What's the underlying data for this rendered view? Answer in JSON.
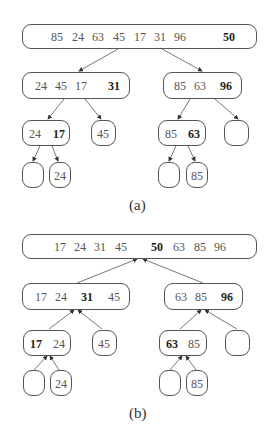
{
  "figure": {
    "part_a": {
      "caption": "(a)",
      "root": {
        "values": [
          "85",
          "24",
          "63",
          "45",
          "17",
          "31",
          "96"
        ],
        "pivot": "50"
      },
      "left": {
        "values": [
          "24",
          "45",
          "17"
        ],
        "pivot": "31"
      },
      "right": {
        "values": [
          "85",
          "63"
        ],
        "pivot": "96"
      },
      "left_left": {
        "values": [
          "24"
        ],
        "pivot": "17"
      },
      "left_right": {
        "values": [
          "45"
        ]
      },
      "right_left": {
        "values": [
          "85"
        ],
        "pivot": "63"
      },
      "right_right": {
        "values": []
      },
      "ll_left": {
        "values": []
      },
      "ll_right": {
        "values": [
          "24"
        ]
      },
      "rl_left": {
        "values": []
      },
      "rl_right": {
        "values": [
          "85"
        ]
      }
    },
    "part_b": {
      "caption": "(b)",
      "root": {
        "left": [
          "17",
          "24",
          "31",
          "45"
        ],
        "pivot": "50",
        "right": [
          "63",
          "85",
          "96"
        ]
      },
      "left": {
        "left": [
          "17",
          "24"
        ],
        "pivot": "31",
        "right": [
          "45"
        ]
      },
      "right": {
        "left": [
          "63",
          "85"
        ],
        "pivot": "96"
      },
      "left_left": {
        "pivot": "17",
        "right": [
          "24"
        ]
      },
      "left_right": {
        "values": [
          "45"
        ]
      },
      "right_left": {
        "pivot": "63",
        "right": [
          "85"
        ]
      },
      "right_right": {
        "values": []
      },
      "ll_left": {
        "values": []
      },
      "ll_right": {
        "values": [
          "24"
        ]
      },
      "rl_left": {
        "values": []
      },
      "rl_right": {
        "values": [
          "85"
        ]
      }
    }
  }
}
